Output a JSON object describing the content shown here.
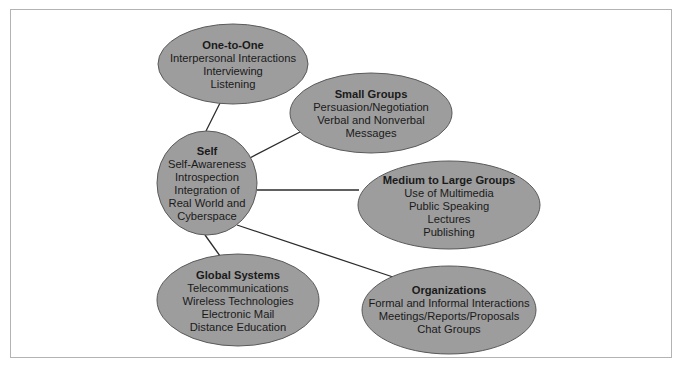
{
  "diagram": {
    "colors": {
      "ellipse_fill": "#9d9d9d",
      "ellipse_stroke": "#5a5a5a",
      "connector": "#2b2b2b",
      "frame": "#b3b3b3",
      "text": "#1a1a1a"
    },
    "center_node": {
      "id": "self",
      "title": "Self",
      "lines": [
        "Self-Awareness",
        "Introspection",
        "Integration of",
        "Real World and",
        "Cyberspace"
      ]
    },
    "nodes": [
      {
        "id": "one-to-one",
        "title": "One-to-One",
        "lines": [
          "Interpersonal Interactions",
          "Interviewing",
          "Listening"
        ]
      },
      {
        "id": "small-groups",
        "title": "Small Groups",
        "lines": [
          "Persuasion/Negotiation",
          "Verbal and Nonverbal",
          "Messages"
        ]
      },
      {
        "id": "medium-to-large-groups",
        "title": "Medium to Large Groups",
        "lines": [
          "Use of Multimedia",
          "Public Speaking",
          "Lectures",
          "Publishing"
        ]
      },
      {
        "id": "organizations",
        "title": "Organizations",
        "lines": [
          "Formal and Informal Interactions",
          "Meetings/Reports/Proposals",
          "Chat Groups"
        ]
      },
      {
        "id": "global-systems",
        "title": "Global Systems",
        "lines": [
          "Telecommunications",
          "Wireless Technologies",
          "Electronic Mail",
          "Distance Education"
        ]
      }
    ],
    "edges": [
      {
        "from": "self",
        "to": "one-to-one"
      },
      {
        "from": "self",
        "to": "small-groups"
      },
      {
        "from": "self",
        "to": "medium-to-large-groups"
      },
      {
        "from": "self",
        "to": "organizations"
      },
      {
        "from": "self",
        "to": "global-systems"
      }
    ]
  }
}
